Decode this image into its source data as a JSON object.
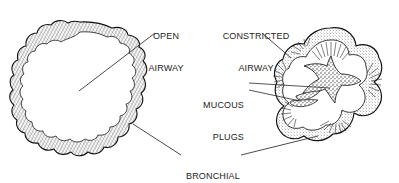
{
  "figure": {
    "background_color": "#ffffff",
    "ink_color": "#1c1c1c",
    "label_font_size_px": 9,
    "label_case": "uppercase"
  },
  "labels": {
    "open_airway": {
      "text": "OPEN\nAIRWAY",
      "line1": "OPEN",
      "line2": "AIRWAY",
      "x": 138,
      "y": 10,
      "align": "center",
      "points_to": "open-airway-lumen"
    },
    "constricted_airway": {
      "text": "CONSTRICTED\nAIRWAY",
      "line1": "CONSTRICTED",
      "line2": "AIRWAY",
      "x": 216,
      "y": 10,
      "align": "center",
      "points_to": "constricted-airway-wall"
    },
    "mucous_plugs": {
      "text": "MUCOUS\nPLUGS",
      "line1": "MUCOUS",
      "line2": "PLUGS",
      "x": 202,
      "y": 79,
      "align": "right",
      "points_to": "mucous-plug-mass"
    },
    "bronchial_mucosa": {
      "text": "BRONCHIAL\nMUCOSA",
      "line1": "BRONCHIAL",
      "line2": "MUCOSA",
      "x": 186,
      "y": 150,
      "align": "center",
      "points_to": "both-airway-walls"
    }
  },
  "diagram_parts": [
    {
      "name": "open-airway",
      "description": "Round, patent bronchiole cross-section with gently scalloped mucosal ring and open white lumen",
      "bounds": {
        "x": 15,
        "y": 22,
        "width": 130,
        "height": 133
      }
    },
    {
      "name": "constricted-airway",
      "description": "Clover-shaped constricted bronchiole with thickened, radially hatched mucosa and a narrow star-shaped lumen filled with mucous plugs",
      "bounds": {
        "x": 276,
        "y": 28,
        "width": 108,
        "height": 118
      }
    }
  ],
  "leader_lines": [
    {
      "name": "leader-open-airway",
      "from_label": "open_airway",
      "to_part": "open-airway-lumen"
    },
    {
      "name": "leader-constricted-airway",
      "from_label": "constricted_airway",
      "to_part": "constricted-airway-wall"
    },
    {
      "name": "leader-mucous-plugs-upper",
      "from_label": "mucous_plugs",
      "to_part": "mucous-plug-central"
    },
    {
      "name": "leader-mucous-plugs-lower",
      "from_label": "mucous_plugs",
      "to_part": "mucous-plug-lower"
    },
    {
      "name": "leader-bronchial-mucosa-left",
      "from_label": "bronchial_mucosa",
      "to_part": "open-airway-wall"
    },
    {
      "name": "leader-bronchial-mucosa-right",
      "from_label": "bronchial_mucosa",
      "to_part": "constricted-airway-wall"
    }
  ]
}
